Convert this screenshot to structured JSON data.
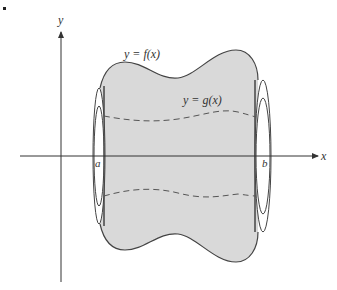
{
  "figure": {
    "type": "solid-of-revolution-washer",
    "labels": {
      "y_axis": "y",
      "x_axis": "x",
      "outer_curve": "y = f(x)",
      "inner_curve": "y = g(x)",
      "left_bound": "a",
      "right_bound": "b"
    },
    "colors": {
      "fill": "#d9d9d9",
      "stroke": "#444444",
      "dashed": "#555555",
      "axis": "#333333"
    }
  }
}
